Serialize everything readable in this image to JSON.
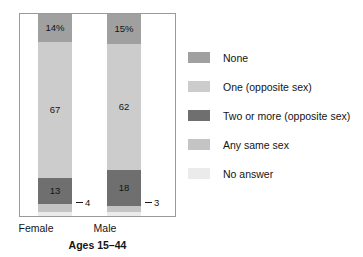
{
  "chart_data": {
    "type": "bar",
    "subtype": "stacked-100-percent",
    "title": "",
    "xlabel": "Ages 15–44",
    "ylabel": "",
    "ylim": [
      0,
      100
    ],
    "grid": false,
    "legend_position": "right",
    "categories": [
      "Female",
      "Male"
    ],
    "series": [
      {
        "name": "None",
        "color": "#a0a0a0",
        "values": [
          14,
          15
        ],
        "labels": [
          "14%",
          "15%"
        ]
      },
      {
        "name": "One (opposite sex)",
        "color": "#cccccc",
        "values": [
          67,
          62
        ],
        "labels": [
          "67",
          "62"
        ]
      },
      {
        "name": "Two or more (opposite sex)",
        "color": "#6f6f6f",
        "values": [
          13,
          18
        ],
        "labels": [
          "13",
          "18"
        ]
      },
      {
        "name": "Any same sex",
        "color": "#c4c4c4",
        "values": [
          4,
          3
        ],
        "labels": [
          "4",
          "3"
        ]
      },
      {
        "name": "No answer",
        "color": "#ebebeb",
        "values": [
          2,
          2
        ],
        "labels": [
          "",
          ""
        ]
      }
    ],
    "annotations": [
      {
        "text": "4",
        "series": "Any same sex",
        "category": "Female",
        "style": "leader-dash"
      },
      {
        "text": "3",
        "series": "Any same sex",
        "category": "Male",
        "style": "leader-dash"
      }
    ]
  },
  "axis": {
    "title": "Ages 15–44",
    "tick_labels": {
      "female": "Female",
      "male": "Male"
    }
  },
  "bars": {
    "female": {
      "none": {
        "label": "14%",
        "value": 14
      },
      "one": {
        "label": "67",
        "value": 67
      },
      "two_plus": {
        "label": "13",
        "value": 13
      },
      "same_sex": {
        "label": "4",
        "value": 4
      },
      "no_answer": {
        "label": "",
        "value": 2
      }
    },
    "male": {
      "none": {
        "label": "15%",
        "value": 15
      },
      "one": {
        "label": "62",
        "value": 62
      },
      "two_plus": {
        "label": "18",
        "value": 18
      },
      "same_sex": {
        "label": "3",
        "value": 3
      },
      "no_answer": {
        "label": "",
        "value": 2
      }
    }
  },
  "legend": {
    "items": [
      {
        "label": "None",
        "color": "#a0a0a0"
      },
      {
        "label": "One (opposite sex)",
        "color": "#cccccc"
      },
      {
        "label": "Two or more (opposite sex)",
        "color": "#6f6f6f"
      },
      {
        "label": "Any same sex",
        "color": "#c4c4c4"
      },
      {
        "label": "No answer",
        "color": "#ebebeb"
      }
    ]
  }
}
